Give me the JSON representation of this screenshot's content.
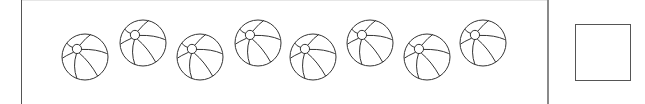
{
  "worksheet": {
    "task": "count-objects",
    "object_name": "beach ball",
    "object_count": 8,
    "answer_box": {
      "value": ""
    }
  },
  "balls": [
    {
      "cx": 85,
      "cy": 57,
      "r": 23
    },
    {
      "cx": 143,
      "cy": 43,
      "r": 23
    },
    {
      "cx": 200,
      "cy": 57,
      "r": 23
    },
    {
      "cx": 258,
      "cy": 43,
      "r": 23
    },
    {
      "cx": 313,
      "cy": 57,
      "r": 23
    },
    {
      "cx": 370,
      "cy": 43,
      "r": 23
    },
    {
      "cx": 427,
      "cy": 57,
      "r": 23
    },
    {
      "cx": 483,
      "cy": 43,
      "r": 23
    }
  ],
  "colors": {
    "stroke": "#333333",
    "background": "#ffffff",
    "divider": "#8a8a8a"
  }
}
